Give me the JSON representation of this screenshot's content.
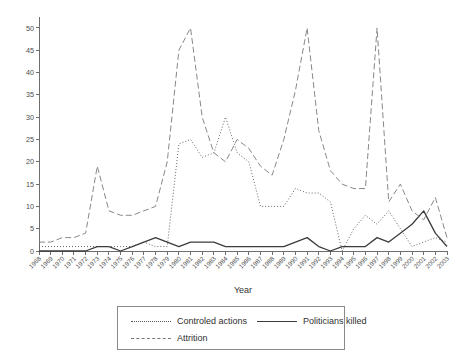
{
  "chart_data": {
    "type": "line",
    "title": "",
    "xlabel": "Year",
    "ylabel": "",
    "xlim": [
      1968,
      2003
    ],
    "ylim": [
      0,
      52
    ],
    "yticks": [
      0,
      5,
      10,
      15,
      20,
      25,
      30,
      35,
      40,
      45,
      50
    ],
    "grid": false,
    "legend_position": "bottom",
    "categories": [
      "1968",
      "1969",
      "1970",
      "1971",
      "1972",
      "1973",
      "1974",
      "1975",
      "1976",
      "1977",
      "1978",
      "1979",
      "1980",
      "1981",
      "1982",
      "1983",
      "1984",
      "1985",
      "1986",
      "1987",
      "1988",
      "1989",
      "1990",
      "1991",
      "1992",
      "1993",
      "1994",
      "1995",
      "1996",
      "1997",
      "1998",
      "1999",
      "2000",
      "2001",
      "2002",
      "2003"
    ],
    "series": [
      {
        "name": "Controled actions",
        "style": "dotted",
        "color": "#555555",
        "values": [
          1,
          1,
          1,
          1,
          1,
          1,
          1,
          1,
          1,
          2,
          1,
          1,
          24,
          25,
          21,
          22,
          30,
          22,
          20,
          10,
          10,
          10,
          14,
          13,
          13,
          11,
          0,
          5,
          8,
          6,
          9,
          5,
          1,
          2,
          3,
          2
        ]
      },
      {
        "name": "Politicians killed",
        "style": "solid",
        "color": "#3c3c3c",
        "values": [
          0,
          0,
          0,
          0,
          0,
          1,
          1,
          0,
          1,
          2,
          3,
          2,
          1,
          2,
          2,
          2,
          1,
          1,
          1,
          1,
          1,
          1,
          2,
          3,
          1,
          0,
          1,
          1,
          1,
          3,
          2,
          4,
          6,
          9,
          4,
          1
        ]
      },
      {
        "name": "Attrition",
        "style": "dashed",
        "color": "#7a7a7a",
        "values": [
          2,
          2,
          3,
          3,
          4,
          19,
          9,
          8,
          8,
          9,
          10,
          20,
          45,
          50,
          30,
          22,
          20,
          25,
          23,
          19,
          17,
          25,
          36,
          50,
          27,
          18,
          15,
          14,
          14,
          50,
          11,
          15,
          9,
          7,
          12,
          3
        ]
      }
    ]
  },
  "axis": {
    "x_title": "Year"
  },
  "legend": {
    "items": [
      {
        "label": "Controled actions",
        "key": "dotted"
      },
      {
        "label": "Politicians killed",
        "key": "solid"
      },
      {
        "label": "Attrition",
        "key": "dashed"
      }
    ]
  }
}
